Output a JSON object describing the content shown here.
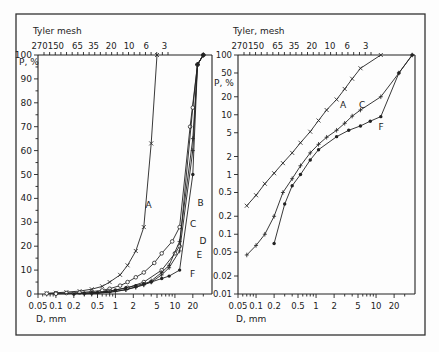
{
  "chart_data": [
    {
      "type": "line",
      "panel": "left",
      "title": "",
      "top_axis_label": "Tyler mesh",
      "top_tick_labels": [
        "270",
        "150",
        "65",
        "35",
        "20",
        "10",
        "6",
        "3"
      ],
      "xlabel": "D, mm",
      "ylabel": "P, %",
      "xscale": "log",
      "yscale": "linear",
      "xlim": [
        0.05,
        40
      ],
      "ylim": [
        0,
        100
      ],
      "x_tick_labels": [
        "0.05",
        "0.1",
        "0.2",
        "0.5",
        "1",
        "2",
        "5",
        "10",
        "20"
      ],
      "y_tick_labels": [
        "0",
        "10",
        "20",
        "30",
        "40",
        "50",
        "60",
        "70",
        "80",
        "90",
        "100"
      ],
      "grid": false,
      "series": [
        {
          "name": "A",
          "marker": "x",
          "x": [
            0.07,
            0.1,
            0.15,
            0.25,
            0.4,
            0.6,
            0.8,
            1.2,
            1.6,
            2.2,
            3,
            4,
            5
          ],
          "y": [
            0.3,
            0.5,
            0.8,
            1.2,
            2,
            3.2,
            5,
            8,
            12,
            18,
            28,
            63,
            100
          ]
        },
        {
          "name": "B",
          "marker": "o",
          "x": [
            0.07,
            0.1,
            0.15,
            0.25,
            0.4,
            0.6,
            0.8,
            1.2,
            1.6,
            2.2,
            3,
            4.5,
            6,
            9,
            12,
            18,
            24,
            30
          ],
          "y": [
            0.2,
            0.3,
            0.4,
            0.6,
            1,
            1.5,
            2.2,
            3.5,
            5,
            7,
            9,
            13,
            17,
            22,
            28,
            70,
            96,
            100
          ]
        },
        {
          "name": "C",
          "marker": "o",
          "x": [
            0.1,
            0.2,
            0.4,
            0.8,
            1.6,
            3,
            6,
            10,
            12,
            20,
            24,
            30
          ],
          "y": [
            0.1,
            0.2,
            0.5,
            1.2,
            2.6,
            5,
            10,
            17,
            20,
            78,
            96,
            100
          ]
        },
        {
          "name": "D",
          "marker": "+",
          "x": [
            0.3,
            0.5,
            1,
            1.5,
            2.2,
            3,
            4,
            6,
            8,
            12,
            20,
            24,
            30
          ],
          "y": [
            0.1,
            0.3,
            1,
            1.8,
            3,
            4,
            5.5,
            9,
            12,
            22,
            65,
            96,
            100
          ]
        },
        {
          "name": "E",
          "marker": "+",
          "x": [
            0.4,
            0.8,
            1.5,
            2.2,
            3,
            4,
            6,
            8,
            12,
            20,
            24,
            30
          ],
          "y": [
            0.2,
            0.8,
            1.8,
            2.8,
            3.8,
            5,
            8,
            11,
            18,
            60,
            96,
            100
          ]
        },
        {
          "name": "F",
          "marker": "dot",
          "x": [
            0.2,
            0.3,
            0.4,
            0.5,
            0.7,
            1,
            1.5,
            2.2,
            3,
            4,
            6,
            8,
            12,
            20,
            24,
            30
          ],
          "y": [
            0.07,
            0.3,
            0.5,
            0.65,
            1,
            1.7,
            2.6,
            3.5,
            4.3,
            5,
            6.5,
            7.5,
            10,
            50,
            96,
            100
          ]
        }
      ],
      "annotations": [
        "A",
        "B",
        "C",
        "D",
        "E",
        "F"
      ]
    },
    {
      "type": "line",
      "panel": "right",
      "title": "",
      "top_axis_label": "Tyler, mesh",
      "top_tick_labels": [
        "270",
        "150",
        "65",
        "35",
        "20",
        "10",
        "6",
        "3"
      ],
      "xlabel": "D, mm",
      "ylabel": "P, %",
      "xscale": "log",
      "yscale": "log",
      "xlim": [
        0.05,
        40
      ],
      "ylim": [
        0.01,
        100
      ],
      "x_tick_labels": [
        "0.05",
        "0.1",
        "0.2",
        "0.5",
        "1",
        "2",
        "5",
        "10",
        "20"
      ],
      "y_tick_labels": [
        "0.01",
        "0.02",
        "0.05",
        "0.1",
        "0.2",
        "0.5",
        "1",
        "2",
        "5",
        "10",
        "20",
        "50",
        "100"
      ],
      "grid": false,
      "series": [
        {
          "name": "A",
          "marker": "x",
          "x": [
            0.07,
            0.1,
            0.14,
            0.2,
            0.28,
            0.4,
            0.55,
            0.8,
            1.1,
            1.5,
            2.2,
            3,
            4,
            5.5,
            12
          ],
          "y": [
            0.3,
            0.45,
            0.7,
            1.05,
            1.55,
            2.3,
            3.4,
            5.2,
            8,
            12,
            18,
            27,
            40,
            60,
            100
          ]
        },
        {
          "name": "C",
          "marker": "+",
          "x": [
            0.07,
            0.1,
            0.14,
            0.2,
            0.28,
            0.4,
            0.55,
            0.8,
            1.1,
            1.5,
            2.2,
            3,
            4,
            5.5,
            12,
            24,
            40
          ],
          "y": [
            0.045,
            0.065,
            0.1,
            0.2,
            0.5,
            0.85,
            1.4,
            2.3,
            3.2,
            4.2,
            5.5,
            7.2,
            9.5,
            12,
            20,
            50,
            100
          ]
        },
        {
          "name": "F",
          "marker": "dot",
          "x": [
            0.2,
            0.3,
            0.4,
            0.55,
            0.8,
            1.1,
            2.2,
            3.5,
            5.5,
            8,
            12,
            24,
            40
          ],
          "y": [
            0.07,
            0.32,
            0.65,
            1,
            1.75,
            2.6,
            4.3,
            5.5,
            6.5,
            7.8,
            9.3,
            50,
            100
          ]
        }
      ],
      "annotations": [
        "A",
        "C",
        "F"
      ]
    }
  ]
}
